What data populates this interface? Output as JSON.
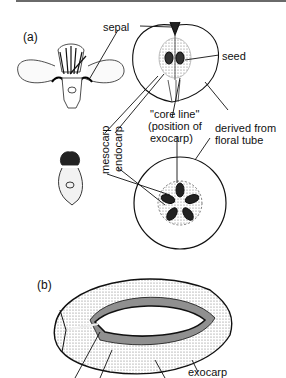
{
  "figure": {
    "panel_a": {
      "label": "(a)",
      "labels": {
        "sepal": "sepal",
        "seed": "seed",
        "core_line_1": "\"core line\"",
        "core_line_2": "(position of",
        "core_line_3": "exocarp)",
        "derived_1": "derived from",
        "derived_2": "floral tube",
        "mesocarp": "mesocarp",
        "endocarp": "endocarp"
      }
    },
    "panel_b": {
      "label": "(b)",
      "labels": {
        "exocarp": "exocarp"
      }
    }
  }
}
